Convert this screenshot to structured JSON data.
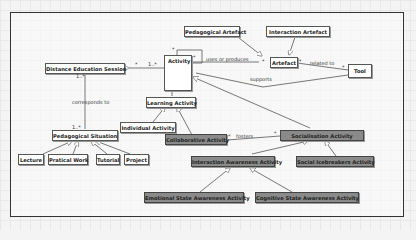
{
  "diagram": {
    "type": "UML class diagram",
    "classes": {
      "distance_education_session": "Distance Education Session",
      "activity": "Activity",
      "pedagogical_artefact": "Pedagogical Artefact",
      "interaction_artefact": "Interaction Artefact",
      "artefact": "Artefact",
      "tool": "Tool",
      "learning_activity": "Learning Activity",
      "individual_activity": "Individual Activity",
      "collaborative_activity": "Collaborative Activity",
      "socialisation_activity": "Socialisation Activity",
      "interaction_awareness_activity": "Interaction Awareness Activity",
      "social_icebreakers_activity": "Social Icebreakers Activity",
      "emotional_state_awareness_activity": "Emotional State Awareness Activity",
      "cognitive_state_awareness_activity": "Cognitive State Awareness Activity",
      "pedagogical_situation": "Pedagogical Situation",
      "lecture": "Lecture",
      "pratical_work": "Pratical Work",
      "tutorial": "Tutorial",
      "project": "Project"
    },
    "associations": {
      "uses_or_produces": "uses or produces",
      "related_to": "related to",
      "supports": "supports",
      "corresponds_to": "corresponds to",
      "fosters": "fosters"
    },
    "multiplicities": {
      "star": "*",
      "one_many": "1..*"
    },
    "colors": {
      "highlighted_class": "#8a8a8a",
      "plain_class": "#ffffff",
      "frame": "#333333"
    }
  }
}
